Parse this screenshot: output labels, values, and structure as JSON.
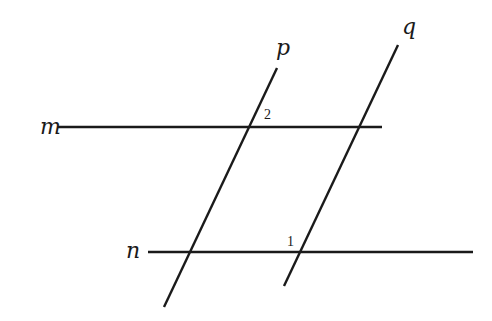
{
  "diagram": {
    "type": "parallel-lines-with-transversals",
    "lines": [
      {
        "id": "m",
        "label": "m",
        "x1": 58,
        "y1": 127,
        "x2": 382,
        "y2": 127,
        "label_x": 40,
        "label_y": 134
      },
      {
        "id": "n",
        "label": "n",
        "x1": 148,
        "y1": 252,
        "x2": 473,
        "y2": 252,
        "label_x": 126,
        "label_y": 258
      },
      {
        "id": "p",
        "label": "p",
        "x1": 277,
        "y1": 68,
        "x2": 164,
        "y2": 307,
        "label_x": 276,
        "label_y": 55
      },
      {
        "id": "q",
        "label": "q",
        "x1": 398,
        "y1": 45,
        "x2": 284,
        "y2": 286,
        "label_x": 402,
        "label_y": 34
      }
    ],
    "angles": [
      {
        "id": "angle-2",
        "label": "2",
        "x": 264,
        "y": 119
      },
      {
        "id": "angle-1",
        "label": "1",
        "x": 287,
        "y": 246
      }
    ]
  }
}
